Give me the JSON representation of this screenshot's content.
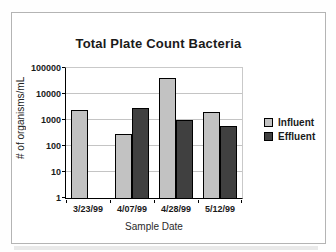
{
  "page": {
    "background": "#fefefe",
    "frame_border_color": "#b4b4b4"
  },
  "chart_data": {
    "type": "bar",
    "title": "Total Plate Count Bacteria",
    "xlabel": "Sample Date",
    "ylabel": "# of organisms/mL",
    "y_scale": "log",
    "ylim": [
      1,
      100000
    ],
    "y_ticks": [
      100000,
      10000,
      1000,
      100,
      10,
      1
    ],
    "grid": true,
    "legend_position": "right",
    "categories": [
      "3/23/99",
      "4/07/99",
      "4/28/99",
      "5/12/99"
    ],
    "series": [
      {
        "name": "Influent",
        "color": "#c2c2c2",
        "values": [
          2500,
          300,
          40000,
          2000
        ]
      },
      {
        "name": "Effluent",
        "color": "#404040",
        "values": [
          null,
          2800,
          1000,
          600
        ]
      }
    ],
    "colors": {
      "gridline": "#c4c4c4",
      "axis": "#000000",
      "influent": "#c2c2c2",
      "effluent": "#404040"
    }
  }
}
